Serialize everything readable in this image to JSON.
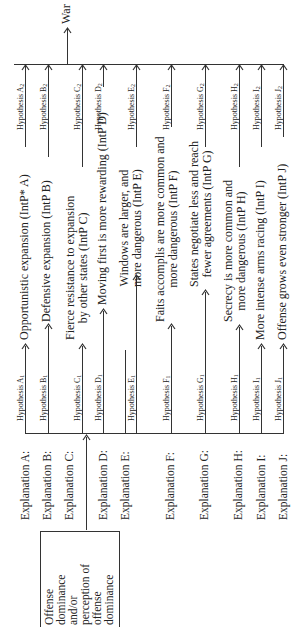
{
  "diagram": {
    "source": {
      "lines": [
        "Offense",
        "dominance",
        "and/or",
        "perception of",
        "offense",
        "dominance"
      ]
    },
    "outcome": "War",
    "rows": [
      {
        "explanation": "Explanation A:",
        "h1": "Hypothesis A",
        "h1_sub": "1",
        "intervening": [
          "Opportunistic expansion (IntP* A)"
        ],
        "h2": "Hypothesis A",
        "h2_sub": "2"
      },
      {
        "explanation": "Explanation B:",
        "h1": "Hypothesis B",
        "h1_sub": "1",
        "intervening": [
          "Defensive expansion (IntP B)"
        ],
        "h2": "Hypothesis B",
        "h2_sub": "2"
      },
      {
        "explanation": "Explanation C:",
        "h1": "Hypothesis C",
        "h1_sub": "1",
        "intervening": [
          "Fierce resistance to expansion",
          "by other states (IntP C)"
        ],
        "h2": "Hypothesis C",
        "h2_sub": "2"
      },
      {
        "explanation": "Explanation D:",
        "h1": "Hypothesis D",
        "h1_sub": "1",
        "intervening": [
          "Moving first is more rewarding (IntP D)"
        ],
        "h2": "Hypothesis D",
        "h2_sub": "2"
      },
      {
        "explanation": "Explanation E:",
        "h1": "Hypothesis E",
        "h1_sub": "1",
        "intervening": [
          "Windows are larger, and",
          "more dangerous (IntP E)"
        ],
        "h2": "Hypothesis E",
        "h2_sub": "2"
      },
      {
        "explanation": "Explanation F:",
        "h1": "Hypothesis F",
        "h1_sub": "1",
        "intervening": [
          "Faits accomplis are more common and",
          "more dangerous (IntP F)"
        ],
        "h2": "Hypothesis F",
        "h2_sub": "2"
      },
      {
        "explanation": "Explanation G:",
        "h1": "Hypothesis G",
        "h1_sub": "1",
        "intervening": [
          "States negotiate less and reach",
          "fewer agreements (IntP G)"
        ],
        "h2": "Hypothesis G",
        "h2_sub": "2"
      },
      {
        "explanation": "Explanation H:",
        "h1": "Hypothesis H",
        "h1_sub": "1",
        "intervening": [
          "Secrecy is more common and",
          "more dangerous (IntP H)"
        ],
        "h2": "Hypothesis H",
        "h2_sub": "2"
      },
      {
        "explanation": "Explanation I:",
        "h1": "Hypothesis I",
        "h1_sub": "1",
        "intervening": [
          "More intense arms racing (IntP I)"
        ],
        "h2": "Hypothesis I",
        "h2_sub": "2"
      },
      {
        "explanation": "Explanation J:",
        "h1": "Hypothesis J",
        "h1_sub": "1",
        "intervening": [
          "Offense grows even stronger (IntP J)"
        ],
        "h2": "Hypothesis J",
        "h2_sub": "2"
      }
    ]
  }
}
